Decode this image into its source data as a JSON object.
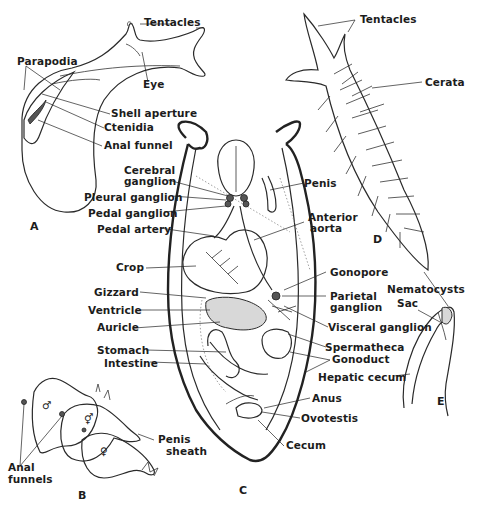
{
  "figure": {
    "panels": [
      {
        "id": "A",
        "label": "A",
        "title": "Sea hare (lateral view)"
      },
      {
        "id": "B",
        "label": "B",
        "title": "Mating chain"
      },
      {
        "id": "C",
        "label": "C",
        "title": "Internal anatomy (dorsal dissection)"
      },
      {
        "id": "D",
        "label": "D",
        "title": "Nudibranch (aeolid)"
      },
      {
        "id": "E",
        "label": "E",
        "title": "Ceras detail"
      }
    ],
    "panel_A": {
      "labels": {
        "tentacles": "Tentacles",
        "parapodia": "Parapodia",
        "eye": "Eye",
        "shell_aperture": "Shell aperture",
        "ctenidia": "Ctenidia",
        "anal_funnel": "Anal funnel"
      }
    },
    "panel_B": {
      "labels": {
        "anal_funnels": [
          "Anal",
          "funnels"
        ],
        "penis_sheath": [
          "Penis",
          "sheath"
        ]
      },
      "symbols": {
        "male": "♂",
        "hermaphrodite": "⚥",
        "female": "♀"
      }
    },
    "panel_C": {
      "labels": {
        "cerebral_ganglion": [
          "Cerebral",
          "ganglion"
        ],
        "pleural_ganglion": "Pleural ganglion",
        "pedal_ganglion": "Pedal ganglion",
        "pedal_artery": "Pedal artery",
        "crop": "Crop",
        "gizzard": "Gizzard",
        "ventricle": "Ventricle",
        "auricle": "Auricle",
        "stomach": "Stomach",
        "intestine": "Intestine",
        "penis": "Penis",
        "anterior_aorta": [
          "Anterior",
          "aorta"
        ],
        "gonopore": "Gonopore",
        "parietal_ganglion": [
          "Parietal",
          "ganglion"
        ],
        "visceral_ganglion": "Visceral ganglion",
        "spermatheca": "Spermatheca",
        "gonoduct": "Gonoduct",
        "anus": "Anus",
        "ovotestis": "Ovotestis",
        "cecum": "Cecum"
      }
    },
    "panel_D": {
      "labels": {
        "tentacles": "Tentacles",
        "cerata": "Cerata"
      }
    },
    "panel_E": {
      "labels": {
        "nematocysts": "Nematocysts",
        "sac": "Sac",
        "hepatic_cecum": "Hepatic cecum"
      }
    }
  }
}
